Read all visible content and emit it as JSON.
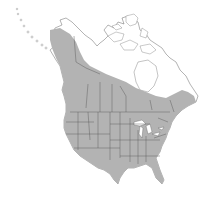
{
  "map": {
    "type": "species-range-map",
    "region": "North America",
    "legend": [],
    "colors": {
      "background": "#ffffff",
      "land": "#ffffff",
      "range_fill": "#b3b3b3",
      "borders": "#555555"
    },
    "range_description": "Shaded distribution covering the contiguous United States, southern and western Canada, and extending northwest through British Columbia and Yukon into interior Alaska; northern Canada, Arctic islands and Greenland edge unshaded"
  }
}
